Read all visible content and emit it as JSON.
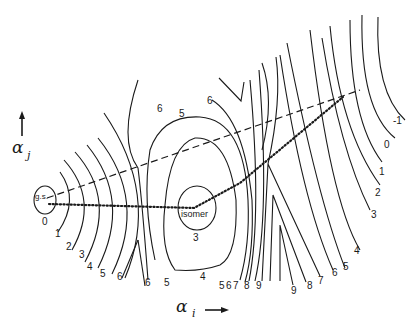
{
  "diagram": {
    "type": "potential energy surface contour map",
    "axes": {
      "x": {
        "symbol": "α",
        "subscript": "i",
        "arrow": "right"
      },
      "y": {
        "symbol": "α",
        "subscript": "j",
        "arrow": "up"
      }
    },
    "minima": {
      "ground_state": {
        "label": "g.s.",
        "contour": "0"
      },
      "isomer": {
        "label": "isomer",
        "contour": "3"
      }
    },
    "paths": [
      {
        "name": "dashed path",
        "style": "dashed",
        "from": "g.s.",
        "to": "upper right"
      },
      {
        "name": "dotted path",
        "style": "dotted",
        "from": "g.s.",
        "via": "isomer",
        "to": "upper right"
      }
    ],
    "contour_labels": {
      "left_family": [
        "0",
        "1",
        "2",
        "3",
        "4",
        "5",
        "6"
      ],
      "left_saddle": [
        "6",
        "6",
        "5"
      ],
      "isomer_well": [
        "6",
        "5",
        "3",
        "4",
        "6"
      ],
      "bottom_right": [
        "5",
        "6",
        "7",
        "8",
        "9",
        "9",
        "8",
        "7",
        "6",
        "5",
        "4"
      ],
      "right_family": [
        "3",
        "2",
        "1",
        "0",
        "-1"
      ]
    }
  }
}
